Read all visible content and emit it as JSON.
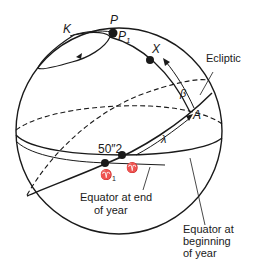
{
  "figure": {
    "labels": {
      "P": "P",
      "P1_main": "P",
      "P1_sub": "1",
      "K": "K",
      "X": "X",
      "ecliptic": "Ecliptic",
      "beta": "β",
      "A": "A",
      "lambda": "λ",
      "precession_amount": "50″2",
      "aries": "♈",
      "aries1_main": "♈",
      "aries1_sub": "1",
      "equator_end_line1": "Equator at end",
      "equator_end_line2": "of year",
      "equator_begin_line1": "Equator at",
      "equator_begin_line2": "beginning",
      "equator_begin_line3": "of year"
    },
    "colors": {
      "ink": "#1a1a1a",
      "background": "#ffffff"
    }
  }
}
